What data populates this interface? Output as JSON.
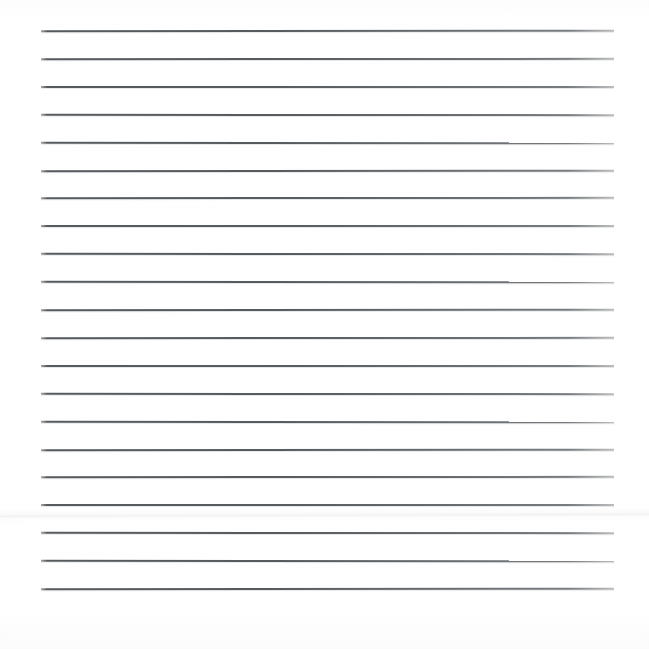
{
  "document": {
    "kind": "scanned-ruled-paper",
    "title": "Blank ruled notebook page",
    "caption": "A scanned blank sheet of ruled (lined) paper with evenly spaced horizontal rules and no written content.",
    "background_color": "#fefefe",
    "width_px": 649,
    "height_px": 649
  },
  "ruling": {
    "line_color": "#4e5256",
    "line_thickness_px": 2,
    "line_left_px": 41,
    "line_right_px": 614,
    "line_length_px": 573,
    "line_count": 21,
    "line_spacing_px": 27.9,
    "first_line_y_px": 31,
    "last_line_y_px": 589,
    "margin_left_px": 41,
    "margin_right_px": 35,
    "margin_top_px": 31,
    "margin_bottom_px": 60,
    "has_vertical_margin_rule": false,
    "lines_y_px": [
      31,
      58.9,
      86.8,
      114.7,
      142.6,
      170.5,
      198.4,
      226.3,
      254.2,
      282.1,
      310,
      337.9,
      365.8,
      393.7,
      421.6,
      449.5,
      477.4,
      505.3,
      533.2,
      561.1,
      589
    ]
  },
  "artifacts": {
    "crease": {
      "label": "horizontal fold crease",
      "y_px": 515,
      "visible": true
    }
  },
  "content": {
    "text_present": false,
    "written_text": ""
  }
}
